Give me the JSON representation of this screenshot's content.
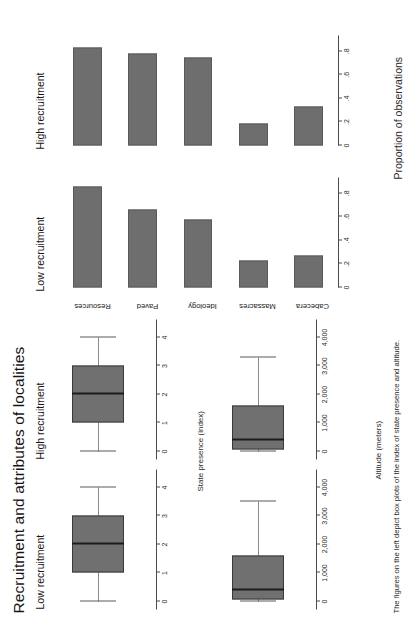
{
  "figure": {
    "title": "Recruitment and attributes of localities",
    "caption": "The figures on the left depict box plots of the index of state presence and altitude.",
    "fill_color": "#6e6e6e",
    "box_fill_color": "#707070",
    "axis_color": "#4a4a4a"
  },
  "panels": {
    "boxplot_state_low": {
      "title": "Low recruitment"
    },
    "boxplot_state_high": {
      "title": "High recruitment"
    },
    "boxplot_alt_low": {
      "title": "Low recruitment"
    },
    "boxplot_alt_high": {
      "title": "High recruitment"
    },
    "bars_low": {
      "title": "Low recruitment"
    },
    "bars_high": {
      "title": "High recruitment"
    }
  },
  "axis_titles": {
    "state_presence": "State presence (index)",
    "altitude": "Altitude (meters)",
    "proportion": "Proportion of observations"
  },
  "ticks": {
    "state_presence": [
      "0",
      "1",
      "2",
      "3",
      "4"
    ],
    "altitude": [
      "0",
      "1,000",
      "2,000",
      "3,000",
      "4,000"
    ],
    "proportion": [
      "0",
      ".2",
      ".4",
      ".6",
      ".8"
    ]
  },
  "chart_data": [
    {
      "type": "bar",
      "title": "Low recruitment",
      "xlabel": "",
      "ylabel": "Proportion of observations",
      "ylim": [
        0,
        0.9
      ],
      "tick_values": [
        0,
        0.2,
        0.4,
        0.6,
        0.8
      ],
      "categories": [
        "Resources",
        "Paved",
        "Ideology",
        "Massacres",
        "Cabecera"
      ],
      "values": [
        0.86,
        0.66,
        0.58,
        0.23,
        0.27
      ]
    },
    {
      "type": "bar",
      "title": "High recruitment",
      "xlabel": "",
      "ylabel": "Proportion of observations",
      "ylim": [
        0,
        0.9
      ],
      "tick_values": [
        0,
        0.2,
        0.4,
        0.6,
        0.8
      ],
      "categories": [
        "Resources",
        "Paved",
        "Ideology",
        "Massacres",
        "Cabecera"
      ],
      "values": [
        0.83,
        0.78,
        0.75,
        0.19,
        0.33
      ]
    },
    {
      "type": "box",
      "title": "Low recruitment",
      "ylabel": "State presence (index)",
      "ylim": [
        0,
        4
      ],
      "tick_values": [
        0,
        1,
        2,
        3,
        4
      ],
      "box": {
        "min": 0,
        "q1": 1,
        "median": 2,
        "q3": 3,
        "max": 4
      }
    },
    {
      "type": "box",
      "title": "High recruitment",
      "ylabel": "State presence (index)",
      "ylim": [
        0,
        4
      ],
      "tick_values": [
        0,
        1,
        2,
        3,
        4
      ],
      "box": {
        "min": 0,
        "q1": 1,
        "median": 2,
        "q3": 3,
        "max": 4
      }
    },
    {
      "type": "box",
      "title": "Low recruitment",
      "ylabel": "Altitude (meters)",
      "ylim": [
        0,
        4000
      ],
      "tick_values": [
        0,
        1000,
        2000,
        3000,
        4000
      ],
      "box": {
        "min": 0,
        "q1": 60,
        "median": 400,
        "q3": 1600,
        "max": 3500
      }
    },
    {
      "type": "box",
      "title": "High recruitment",
      "ylabel": "Altitude (meters)",
      "ylim": [
        0,
        4000
      ],
      "tick_values": [
        0,
        1000,
        2000,
        3000,
        4000
      ],
      "box": {
        "min": 0,
        "q1": 60,
        "median": 400,
        "q3": 1600,
        "max": 3300
      }
    }
  ],
  "bar_categories": [
    "Resources",
    "Paved",
    "Ideology",
    "Massacres",
    "Cabecera"
  ]
}
